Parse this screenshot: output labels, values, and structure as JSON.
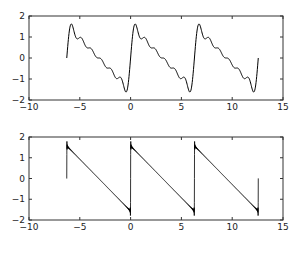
{
  "chart_data": [
    {
      "type": "line",
      "title": "",
      "xlabel": "",
      "ylabel": "",
      "xlim": [
        -10,
        15
      ],
      "ylim": [
        -2,
        2
      ],
      "grid": false,
      "xticks": [
        -10,
        -5,
        0,
        5,
        10,
        15
      ],
      "yticks": [
        -2,
        -1,
        0,
        1,
        2
      ],
      "xtick_labels": [
        "−10",
        "−5",
        "0",
        "5",
        "10",
        "15"
      ],
      "ytick_labels": [
        "−2",
        "−1",
        "0",
        "1",
        "2"
      ],
      "series": [
        {
          "name": "Fourier partial sum of sawtooth (N=6)",
          "function": "sum_{k=1..N} sin(k x)/k",
          "terms": 6,
          "x_range": [
            -6.2832,
            12.5664
          ],
          "color": "#000000"
        }
      ],
      "description": "Sawtooth wave approximated with few Fourier terms; rises from 0 at x=-2π to peak ~1.55 near x=-5.8, ripples down to trough ~-1.55 near x=-0.5, repeats with period 2π, ends at 0 at x=4π"
    },
    {
      "type": "line",
      "title": "",
      "xlabel": "",
      "ylabel": "",
      "xlim": [
        -10,
        15
      ],
      "ylim": [
        -2,
        2
      ],
      "grid": false,
      "xticks": [
        -10,
        -5,
        0,
        5,
        10,
        15
      ],
      "yticks": [
        -2,
        -1,
        0,
        1,
        2
      ],
      "xtick_labels": [
        "−10",
        "−5",
        "0",
        "5",
        "10",
        "15"
      ],
      "ytick_labels": [
        "−2",
        "−1",
        "0",
        "1",
        "2"
      ],
      "series": [
        {
          "name": "Fourier partial sum of sawtooth (many terms)",
          "function": "sum_{k=1..N} sin(k x)/k",
          "terms": 200,
          "x_range": [
            -6.2832,
            12.5664
          ],
          "color": "#000000"
        }
      ],
      "description": "Near-ideal sawtooth with Gibbs overshoot ~1.8 at jumps (x=-2π, 0, 2π, 4π); linear decline from ~1.57 to ~-1.57 each period"
    }
  ],
  "axes": [
    {
      "name": "top",
      "box": {
        "left": 29,
        "top": 16,
        "right": 283,
        "bottom": 100
      }
    },
    {
      "name": "bottom",
      "box": {
        "left": 29,
        "top": 137,
        "right": 283,
        "bottom": 220
      }
    }
  ]
}
